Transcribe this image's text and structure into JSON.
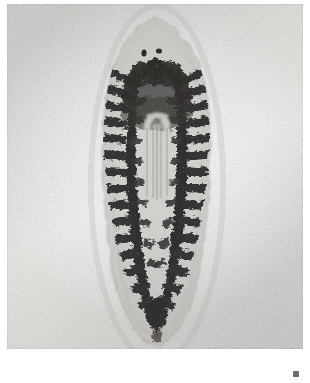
{
  "image": {
    "kind": "photomicrograph",
    "medium": "black-and-white photographic print, scanned",
    "caption_visible": false,
    "width_px": 310,
    "height_px": 383
  },
  "scan": {
    "paper_color": "#ffffff",
    "print_color": "#dedcd9",
    "print_left": 7,
    "print_top": 4,
    "print_width": 296,
    "print_height": 345,
    "artifact": {
      "name": "scan-artifact",
      "color": "#6e6e6e",
      "left": 293,
      "top": 371,
      "size": 6
    }
  },
  "subject": {
    "label": "stained flatworm specimen",
    "common_name": "fluke / trematode whole mount",
    "orientation": "anterior at top, posterior at bottom",
    "body_color": "#8f8c88",
    "stain_color": "#1b1a18",
    "outline_color": "#a6a39e",
    "body": {
      "top": 20,
      "bottom": 347,
      "left": 104,
      "right": 208,
      "widest_y": 215
    },
    "features": [
      {
        "name": "anterior-tip",
        "description": "tapered cone-shaped head region, lightly stained"
      },
      {
        "name": "oral-sucker",
        "description": "two small dark spots near the anterior end"
      },
      {
        "name": "pharynx",
        "description": "dark mass just behind the anterior tip"
      },
      {
        "name": "intestinal-caeca",
        "description": "two dark, heavily branched longitudinal tubes running the length of the body"
      },
      {
        "name": "median-clear-zone",
        "description": "pale unstained column between the caeca in the upper third"
      },
      {
        "name": "posterior-tip",
        "description": "rounded-to-pointed tail end"
      },
      {
        "name": "body-outline",
        "description": "thin translucent margin surrounding the stained organs"
      }
    ]
  },
  "palette": {
    "paper": "#ffffff",
    "print_light": "#e9e7e4",
    "print_mid": "#d2d2d0",
    "print_dark": "#c2c2bf",
    "stain_dark": "#1a1917",
    "stain_mid": "#4a4744",
    "tissue": "#b9b6b1"
  }
}
